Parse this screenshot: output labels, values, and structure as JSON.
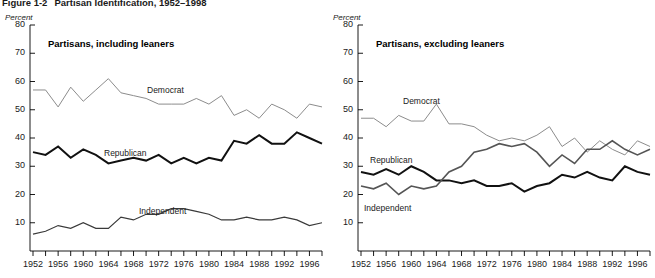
{
  "figure": {
    "number": "Figure 1-2",
    "title": "Partisan Identification, 1952–1998"
  },
  "panels": [
    {
      "id": "including-leaners",
      "title": "Partisans, including leaners",
      "axis_unit": "Percent",
      "series_labels": {
        "democrat": "Democrat",
        "republican": "Republican",
        "independent": "Independent"
      }
    },
    {
      "id": "excluding-leaners",
      "title": "Partisans, excluding leaners",
      "axis_unit": "Percent",
      "series_labels": {
        "democrat": "Democrat",
        "republican": "Republican",
        "independent": "Independent"
      }
    }
  ],
  "chart_data": [
    {
      "type": "line",
      "panel": "left",
      "title": "Partisans, including leaners",
      "xlabel": "",
      "ylabel": "Percent",
      "ylim": [
        0,
        80
      ],
      "yticks": [
        10,
        20,
        30,
        40,
        50,
        60,
        70,
        80
      ],
      "xlim": [
        1952,
        1998
      ],
      "xticks": [
        1952,
        1954,
        1956,
        1958,
        1960,
        1962,
        1964,
        1966,
        1968,
        1970,
        1972,
        1974,
        1976,
        1978,
        1980,
        1982,
        1984,
        1986,
        1988,
        1990,
        1992,
        1994,
        1996,
        1998
      ],
      "xtick_labels": [
        1952,
        1956,
        1960,
        1964,
        1968,
        1972,
        1976,
        1980,
        1984,
        1988,
        1992,
        1996
      ],
      "grid": false,
      "legend_position": "inline-annotations",
      "x": [
        1952,
        1954,
        1956,
        1958,
        1960,
        1962,
        1964,
        1966,
        1968,
        1970,
        1972,
        1974,
        1976,
        1978,
        1980,
        1982,
        1984,
        1986,
        1988,
        1990,
        1992,
        1994,
        1996,
        1998
      ],
      "series": [
        {
          "name": "Democrat",
          "color": "#8c8c8c",
          "width": 1.0,
          "values": [
            57,
            57,
            51,
            58,
            53,
            57,
            61,
            56,
            55,
            54,
            52,
            52,
            52,
            54,
            52,
            55,
            48,
            50,
            47,
            52,
            50,
            47,
            52,
            51
          ]
        },
        {
          "name": "Republican",
          "color": "#111111",
          "width": 2.0,
          "values": [
            35,
            34,
            37,
            33,
            36,
            34,
            31,
            32,
            33,
            32,
            34,
            31,
            33,
            31,
            33,
            32,
            39,
            38,
            41,
            38,
            38,
            42,
            40,
            38
          ]
        },
        {
          "name": "Independent",
          "color": "#3a3a3a",
          "width": 1.2,
          "values": [
            6,
            7,
            9,
            8,
            10,
            8,
            8,
            12,
            11,
            13,
            13,
            15,
            15,
            14,
            13,
            11,
            11,
            12,
            11,
            11,
            12,
            11,
            9,
            10
          ]
        }
      ]
    },
    {
      "type": "line",
      "panel": "right",
      "title": "Partisans, excluding leaners",
      "xlabel": "",
      "ylabel": "Percent",
      "ylim": [
        0,
        80
      ],
      "yticks": [
        10,
        20,
        30,
        40,
        50,
        60,
        70,
        80
      ],
      "xlim": [
        1952,
        1998
      ],
      "xticks": [
        1952,
        1954,
        1956,
        1958,
        1960,
        1962,
        1964,
        1966,
        1968,
        1970,
        1972,
        1974,
        1976,
        1978,
        1980,
        1982,
        1984,
        1986,
        1988,
        1990,
        1992,
        1994,
        1996,
        1998
      ],
      "xtick_labels": [
        1952,
        1956,
        1960,
        1964,
        1968,
        1972,
        1976,
        1980,
        1984,
        1988,
        1992,
        1996
      ],
      "grid": false,
      "legend_position": "inline-annotations",
      "x": [
        1952,
        1954,
        1956,
        1958,
        1960,
        1962,
        1964,
        1966,
        1968,
        1970,
        1972,
        1974,
        1976,
        1978,
        1980,
        1982,
        1984,
        1986,
        1988,
        1990,
        1992,
        1994,
        1996,
        1998
      ],
      "series": [
        {
          "name": "Democrat",
          "color": "#8c8c8c",
          "width": 1.0,
          "values": [
            47,
            47,
            44,
            48,
            46,
            46,
            52,
            45,
            45,
            44,
            41,
            39,
            40,
            39,
            41,
            44,
            37,
            40,
            35,
            39,
            36,
            34,
            39,
            37
          ]
        },
        {
          "name": "Republican",
          "color": "#111111",
          "width": 2.0,
          "values": [
            28,
            27,
            29,
            27,
            30,
            28,
            25,
            25,
            24,
            25,
            23,
            23,
            24,
            21,
            23,
            24,
            27,
            26,
            28,
            26,
            25,
            30,
            28,
            27
          ]
        },
        {
          "name": "Independent",
          "color": "#555555",
          "width": 1.6,
          "values": [
            23,
            22,
            24,
            20,
            23,
            22,
            23,
            28,
            30,
            35,
            36,
            38,
            37,
            38,
            35,
            30,
            34,
            31,
            36,
            36,
            39,
            36,
            34,
            36
          ]
        }
      ]
    }
  ]
}
